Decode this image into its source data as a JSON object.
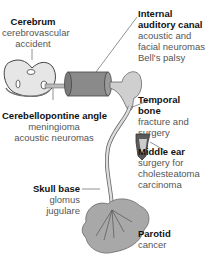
{
  "diagram": {
    "labels": [
      {
        "id": "cerebrum",
        "title": "Cerebrum",
        "lines": [
          "cerebrovascular",
          "accident"
        ]
      },
      {
        "id": "iac",
        "title_lines": [
          "Internal",
          "auditory canal"
        ],
        "lines": [
          "acoustic and",
          "facial neuromas",
          "Bell's palsy"
        ]
      },
      {
        "id": "cpa",
        "title": "Cerebellopontine angle",
        "lines": [
          "meningioma",
          "acoustic neuromas"
        ]
      },
      {
        "id": "temporal",
        "title_lines": [
          "Temporal",
          "bone"
        ],
        "lines": [
          "fracture and",
          "surgery"
        ]
      },
      {
        "id": "middle_ear",
        "title": "Middle ear",
        "lines": [
          "surgery for",
          "cholesteatoma",
          "carcinoma"
        ]
      },
      {
        "id": "skull_base",
        "title": "Skull base",
        "lines": [
          "glomus",
          "jugulare"
        ]
      },
      {
        "id": "parotid",
        "title": "Parotid",
        "lines": [
          "cancer"
        ]
      }
    ],
    "colors": {
      "fill_gray": "#a9a9a9",
      "dark_gray": "#6f6f6f",
      "outline": "#444444",
      "leader": "#777777"
    }
  }
}
